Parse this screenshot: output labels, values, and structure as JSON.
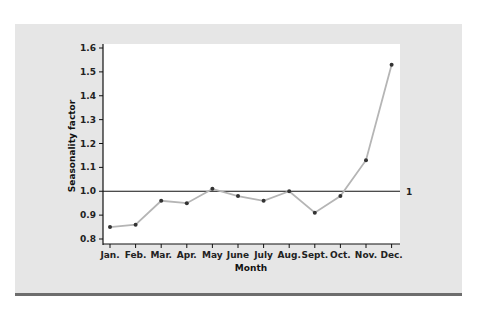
{
  "chart_data": {
    "type": "line",
    "title": "",
    "xlabel": "Month",
    "ylabel": "Seasonality factor",
    "categories": [
      "Jan.",
      "Feb.",
      "Mar.",
      "Apr.",
      "May",
      "June",
      "July",
      "Aug.",
      "Sept.",
      "Oct.",
      "Nov.",
      "Dec."
    ],
    "series": [
      {
        "name": "Seasonality factor",
        "values": [
          0.85,
          0.86,
          0.96,
          0.95,
          1.01,
          0.98,
          0.96,
          1.0,
          0.91,
          0.98,
          1.13,
          1.53
        ]
      }
    ],
    "ylim": [
      0.8,
      1.6
    ],
    "yticks": [
      "0.8",
      "0.9",
      "1.0",
      "1.1",
      "1.2",
      "1.3",
      "1.4",
      "1.5",
      "1.6"
    ],
    "reference_line": {
      "value": 1.0,
      "label": "1"
    },
    "grid": false,
    "legend": "none"
  },
  "colors": {
    "panel_bg": "#e6e6e6",
    "plot_bg": "#ffffff",
    "line": "#b5b5b5",
    "marker": "#333333",
    "axis": "#111111",
    "bottom_rule": "#6d6d6d"
  }
}
